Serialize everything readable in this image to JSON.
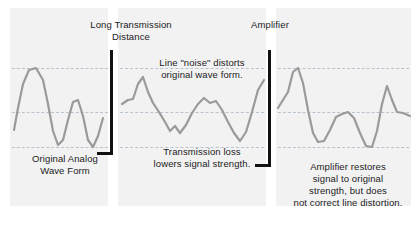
{
  "diagram": {
    "background_color": "#ffffff",
    "panel_color": "#f2f2f2",
    "wave_color": "#9a9a9a",
    "gridline_color": "#b9c3cf",
    "marker_color": "#111111"
  },
  "labels": {
    "long_transmission": "Long Transmission\nDistance",
    "amplifier": "Amplifier",
    "noise": "Line \"noise\" distorts\noriginal wave form.",
    "transmission_loss": "Transmission loss\nlowers signal strength.",
    "original_wave": "Original Analog\nWave Form",
    "amplifier_restores": "Amplifier restores\nsignal to original\nstrength, but does\nnot correct line distortion."
  },
  "chart_data": {
    "type": "line",
    "xlabel": "",
    "ylabel": "Signal amplitude",
    "grid": true,
    "gridlines_y": [
      68,
      112,
      147
    ],
    "legend": "none",
    "panels": [
      {
        "name": "original-analog-wave-form",
        "caption": "Original Analog Wave Form",
        "x_range": [
          14,
          104
        ],
        "amplitude": "full",
        "shape": "smooth-sinusoid",
        "points": [
          [
            14,
            130
          ],
          [
            18,
            108
          ],
          [
            23,
            84
          ],
          [
            29,
            70
          ],
          [
            36,
            68
          ],
          [
            43,
            80
          ],
          [
            48,
            104
          ],
          [
            53,
            131
          ],
          [
            58,
            145
          ],
          [
            63,
            140
          ],
          [
            68,
            120
          ],
          [
            73,
            102
          ],
          [
            78,
            100
          ],
          [
            83,
            116
          ],
          [
            88,
            140
          ],
          [
            93,
            147
          ],
          [
            98,
            136
          ],
          [
            103,
            118
          ]
        ]
      },
      {
        "name": "degraded-wave-form",
        "caption": "Line noise distorts original wave form; transmission loss lowers signal strength.",
        "x_range": [
          122,
          264
        ],
        "amplitude": "reduced",
        "shape": "jagged-attenuated",
        "points": [
          [
            122,
            104
          ],
          [
            128,
            100
          ],
          [
            133,
            99
          ],
          [
            138,
            84
          ],
          [
            143,
            77
          ],
          [
            148,
            92
          ],
          [
            153,
            103
          ],
          [
            159,
            112
          ],
          [
            165,
            122
          ],
          [
            170,
            131
          ],
          [
            175,
            126
          ],
          [
            180,
            133
          ],
          [
            186,
            125
          ],
          [
            192,
            113
          ],
          [
            198,
            104
          ],
          [
            204,
            98
          ],
          [
            210,
            103
          ],
          [
            216,
            101
          ],
          [
            222,
            110
          ],
          [
            228,
            122
          ],
          [
            234,
            133
          ],
          [
            240,
            141
          ],
          [
            246,
            132
          ],
          [
            252,
            112
          ],
          [
            258,
            90
          ],
          [
            264,
            80
          ]
        ]
      },
      {
        "name": "amplified-wave-form",
        "caption": "Amplifier restores signal to original strength, but does not correct line distortion.",
        "x_range": [
          278,
          410
        ],
        "amplitude": "full",
        "shape": "jagged-restored",
        "points": [
          [
            278,
            108
          ],
          [
            283,
            100
          ],
          [
            288,
            92
          ],
          [
            293,
            72
          ],
          [
            298,
            68
          ],
          [
            303,
            83
          ],
          [
            308,
            110
          ],
          [
            313,
            133
          ],
          [
            318,
            142
          ],
          [
            324,
            141
          ],
          [
            330,
            130
          ],
          [
            336,
            117
          ],
          [
            342,
            114
          ],
          [
            348,
            112
          ],
          [
            354,
            118
          ],
          [
            360,
            133
          ],
          [
            366,
            146
          ],
          [
            372,
            147
          ],
          [
            377,
            131
          ],
          [
            382,
            104
          ],
          [
            387,
            86
          ],
          [
            392,
            100
          ],
          [
            397,
            112
          ],
          [
            403,
            113
          ],
          [
            410,
            116
          ]
        ]
      }
    ],
    "markers": [
      {
        "name": "long-transmission-distance-marker",
        "x": 110,
        "y_top": 50,
        "y_bottom": 155
      },
      {
        "name": "amplifier-marker",
        "x": 268,
        "y_top": 50,
        "y_bottom": 167
      }
    ]
  }
}
